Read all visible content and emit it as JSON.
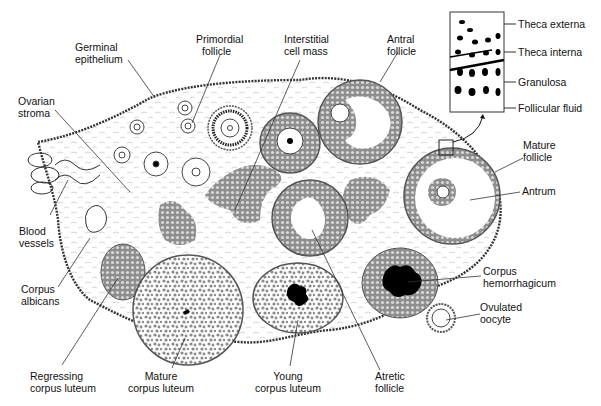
{
  "diagram": {
    "labels": {
      "germinal_epithelium": [
        "Germinal",
        "epithelium"
      ],
      "primordial_follicle": [
        "Primordial",
        "follicle"
      ],
      "interstitial_cell_mass": [
        "Interstitial",
        "cell mass"
      ],
      "antral_follicle": [
        "Antral",
        "follicle"
      ],
      "ovarian_stroma": [
        "Ovarian",
        "stroma"
      ],
      "blood_vessels": [
        "Blood",
        "vessels"
      ],
      "corpus_albicans": [
        "Corpus",
        "albicans"
      ],
      "regressing_corpus_luteum": [
        "Regressing",
        "corpus luteum"
      ],
      "mature_corpus_luteum": [
        "Mature",
        "corpus luteum"
      ],
      "young_corpus_luteum": [
        "Young",
        "corpus luteum"
      ],
      "atretic_follicle": [
        "Atretic",
        "follicle"
      ],
      "corpus_hemorrhagicum": [
        "Corpus",
        "hemorrhagicum"
      ],
      "ovulated_oocyte": [
        "Ovulated",
        "oocyte"
      ],
      "mature_follicle": [
        "Mature",
        "follicle"
      ],
      "antrum": [
        "Antrum"
      ]
    },
    "inset": {
      "labels": [
        "Theca externa",
        "Theca interna",
        "Granulosa",
        "Follicular fluid"
      ]
    },
    "colors": {
      "line": "#222222",
      "cell_fill": "#9a9a9a",
      "stroma": "#bbbbbb",
      "blood": "#000000",
      "background": "#ffffff"
    }
  }
}
